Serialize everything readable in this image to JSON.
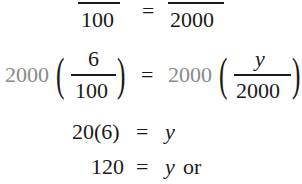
{
  "line1": {
    "left_denominator": "100",
    "equals": "=",
    "right_denominator": "2000"
  },
  "line2": {
    "left_multiplier": "2000",
    "left_numerator": "6",
    "left_denominator": "100",
    "equals": "=",
    "right_multiplier": "2000",
    "right_numerator": "y",
    "right_denominator": "2000",
    "open_paren": "(",
    "close_paren": ")"
  },
  "line3": {
    "lhs": "20(6)",
    "equals": "=",
    "rhs": "y"
  },
  "line4": {
    "lhs": "120",
    "equals": "=",
    "rhs": "y",
    "suffix": "or"
  },
  "colors": {
    "text": "#1a1a1a",
    "multiplier": "#8a8a8a"
  }
}
